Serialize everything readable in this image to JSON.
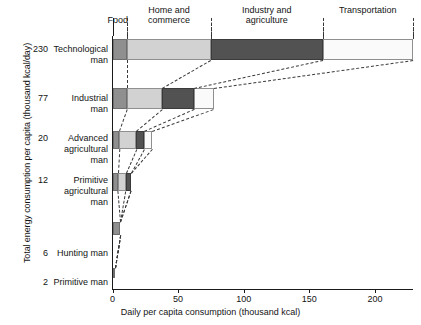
{
  "chart_data": {
    "type": "bar",
    "orientation": "horizontal",
    "stacked": true,
    "title": "",
    "xlabel": "Daily per capita consumption (thousand kcal)",
    "ylabel": "Total energy consumption per capita (thousand kcal/day)",
    "xlim": [
      0,
      229
    ],
    "xticks": [
      0,
      50,
      100,
      150,
      200
    ],
    "xtick_labels": [
      "0",
      "50",
      "100",
      "150",
      "200"
    ],
    "grid": false,
    "legend_position": "top",
    "categories": [
      "Technological man",
      "Industrial man",
      "Advanced agricultural man",
      "Primitive agricultural man",
      "Hunting man",
      "Primitive man"
    ],
    "category_totals": [
      230,
      77,
      20,
      12,
      6,
      2
    ],
    "series": [
      {
        "name": "Food",
        "values": [
          11,
          11,
          5,
          4,
          6,
          2
        ]
      },
      {
        "name": "Home and commerce",
        "values": [
          64,
          27,
          13,
          6,
          0,
          0
        ]
      },
      {
        "name": "Industry and agriculture",
        "values": [
          85,
          24,
          6,
          4,
          0,
          0
        ]
      },
      {
        "name": "Transportation",
        "values": [
          69,
          15,
          6,
          0,
          0,
          0
        ]
      }
    ]
  },
  "axes": {
    "y_title": "Total energy consumption per capita (thousand kcal/day)",
    "x_title": "Daily per capita consumption (thousand kcal)",
    "x_ticks": [
      {
        "label": "0",
        "value": 0
      },
      {
        "label": "50",
        "value": 50
      },
      {
        "label": "100",
        "value": 100
      },
      {
        "label": "150",
        "value": 150
      },
      {
        "label": "200",
        "value": 200
      }
    ]
  },
  "category_headers": [
    {
      "label": "Food"
    },
    {
      "label": "Home and\ncommerce"
    },
    {
      "label": "Industry and\nagriculture"
    },
    {
      "label": "Transportation"
    }
  ],
  "rows": [
    {
      "value": "230",
      "name": "Technological\nman"
    },
    {
      "value": "77",
      "name": "Industrial\nman"
    },
    {
      "value": "20",
      "name": "Advanced\nagricultural\nman"
    },
    {
      "value": "12",
      "name": "Primitive\nagricultural\nman"
    },
    {
      "value": "6",
      "name": "Hunting man"
    },
    {
      "value": "2",
      "name": "Primitive man"
    }
  ],
  "colors": {
    "food": "#8f8f8f",
    "home": "#d2d2d2",
    "industry": "#525252",
    "transport": "#fafafa",
    "axis": "#1a1a1a",
    "connector": "#3a3a3a"
  }
}
